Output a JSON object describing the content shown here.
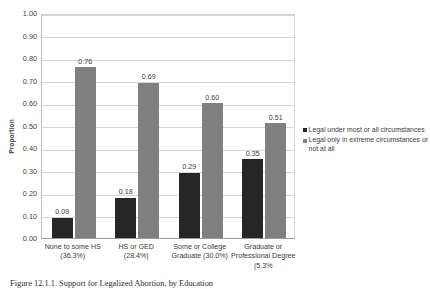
{
  "chart_data": {
    "type": "bar",
    "title": "",
    "xlabel": "",
    "ylabel": "Proportion",
    "ylim": [
      0,
      1.0
    ],
    "ytick_step": 0.1,
    "grid": true,
    "legend_position": "right",
    "categories": [
      "None to some HS (36.3%)",
      "HS or GED (28.4%)",
      "Some or College Graduate (30.0%)",
      "Graduate or Professional Degree (5.3%"
    ],
    "category_lines": [
      [
        "None to some HS",
        "(36.3%)"
      ],
      [
        "HS or GED",
        "(28.4%)"
      ],
      [
        "Some or College",
        "Graduate (30.0%)"
      ],
      [
        "Graduate or",
        "Professional Degree",
        "(5.3%"
      ]
    ],
    "yticks": [
      "0.00",
      "0.10",
      "0.20",
      "0.30",
      "0.40",
      "0.50",
      "0.60",
      "0.70",
      "0.80",
      "0.90",
      "1.00"
    ],
    "series": [
      {
        "name": "Legal under most or all circumstances",
        "color": "#262626",
        "values": [
          0.09,
          0.18,
          0.29,
          0.35
        ],
        "labels": [
          "0.09",
          "0.18",
          "0.29",
          "0.35"
        ]
      },
      {
        "name": "Legal only in extreme circumstances or not at all",
        "color": "#808080",
        "values": [
          0.76,
          0.69,
          0.6,
          0.51
        ],
        "labels": [
          "0.76",
          "0.69",
          "0.60",
          "0.51"
        ]
      }
    ]
  },
  "legend": {
    "entries": [
      {
        "label": "Legal under most or all circumstances",
        "color": "#262626"
      },
      {
        "label": "Legal only in extreme circumstances or not at all",
        "color": "#808080"
      }
    ]
  },
  "caption": {
    "text": "Figure 12.1.1. Support for Legalized Abortion, by Education"
  }
}
